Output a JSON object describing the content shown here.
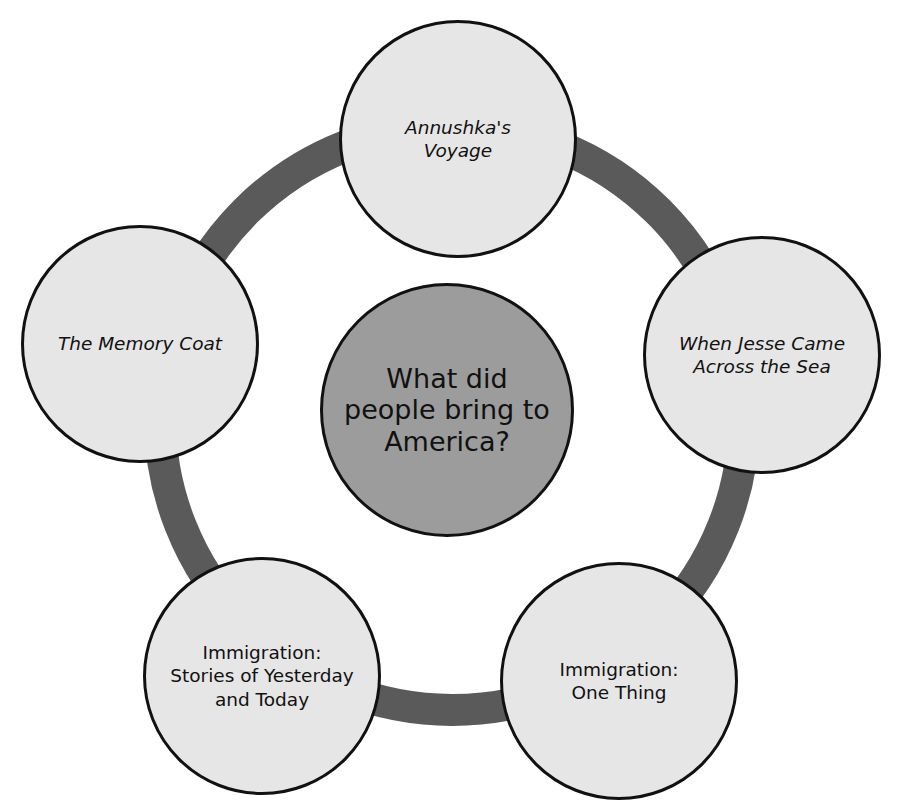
{
  "diagram": {
    "type": "concept-web",
    "colors": {
      "ring": "#5a5a5a",
      "outer_fill": "#e6e6e6",
      "center_fill": "#9c9c9c",
      "outline": "#111111"
    },
    "title_fragment": "",
    "center": {
      "label": "What did\npeople bring to\nAmerica?"
    },
    "nodes": [
      {
        "label": "Annushka's\nVoyage",
        "italic": true
      },
      {
        "label": "When Jesse Came\nAcross the Sea",
        "italic": true
      },
      {
        "label": "Immigration:\nOne Thing",
        "italic": false
      },
      {
        "label": "Immigration:\nStories of Yesterday\nand Today",
        "italic": false
      },
      {
        "label": "The Memory Coat",
        "italic": true
      }
    ]
  }
}
